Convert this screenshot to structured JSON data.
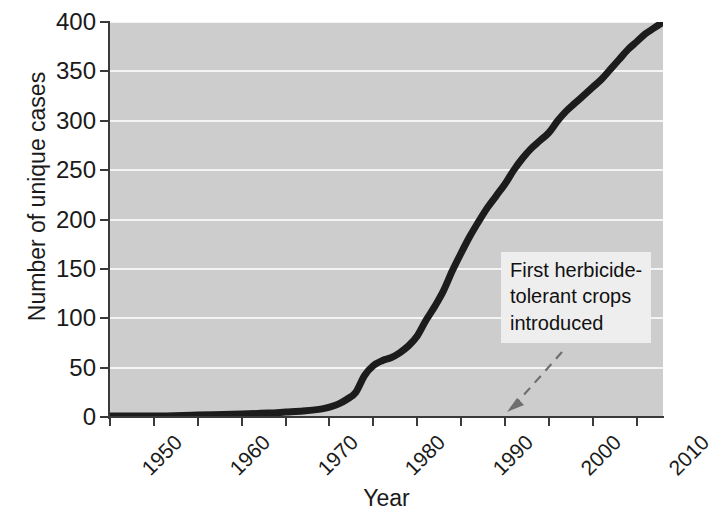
{
  "chart_data": {
    "type": "line",
    "title": "",
    "xlabel": "Year",
    "ylabel": "Number of unique cases",
    "xlim": [
      1950,
      2013
    ],
    "ylim": [
      0,
      400
    ],
    "grid": true,
    "legend": null,
    "y_ticks": [
      0,
      50,
      100,
      150,
      200,
      250,
      300,
      350,
      400
    ],
    "y_tick_labels": [
      "0",
      "50",
      "100",
      "150",
      "200",
      "250",
      "300",
      "350",
      "400"
    ],
    "x_ticks": [
      1950,
      1955,
      1960,
      1965,
      1970,
      1975,
      1980,
      1985,
      1990,
      1995,
      2000,
      2005,
      2010
    ],
    "x_tick_labels_shown": [
      "1950",
      "1960",
      "1970",
      "1980",
      "1990",
      "2000",
      "2010"
    ],
    "x_minor_ticks": [
      1955,
      1965,
      1975,
      1985,
      1995,
      2005
    ],
    "series": [
      {
        "name": "Number of unique cases",
        "color": "#1c1c1c",
        "x": [
          1950,
          1955,
          1960,
          1965,
          1968,
          1970,
          1972,
          1974,
          1975,
          1976,
          1977,
          1978,
          1979,
          1980,
          1981,
          1982,
          1983,
          1984,
          1985,
          1986,
          1987,
          1988,
          1989,
          1990,
          1991,
          1992,
          1993,
          1994,
          1995,
          1996,
          1997,
          1998,
          1999,
          2000,
          2001,
          2002,
          2003,
          2004,
          2005,
          2006,
          2007,
          2008,
          2009,
          2010,
          2011,
          2012,
          2013
        ],
        "y": [
          1,
          1,
          2,
          3,
          4,
          5,
          6,
          8,
          10,
          13,
          18,
          25,
          42,
          52,
          57,
          60,
          65,
          72,
          82,
          98,
          112,
          128,
          148,
          166,
          183,
          198,
          212,
          224,
          236,
          250,
          262,
          272,
          280,
          288,
          300,
          310,
          318,
          326,
          334,
          342,
          352,
          362,
          372,
          380,
          388,
          394,
          400
        ]
      }
    ],
    "annotations": [
      {
        "text": "First herbicide-\ntolerant crops\nintroduced",
        "arrow_target_year": 1996,
        "arrow_target_value": 0
      }
    ]
  },
  "axes": {
    "y_title": "Number of unique cases",
    "x_title": "Year"
  },
  "colors": {
    "plot_background": "#cdcdcd",
    "gridline": "#f4f4f4",
    "axis": "#3a3a3a",
    "curve": "#1c1c1c",
    "annotation_background": "#eeeeee",
    "annotation_text": "#111111",
    "arrow": "#6f6f6f",
    "page_background": "#ffffff"
  }
}
